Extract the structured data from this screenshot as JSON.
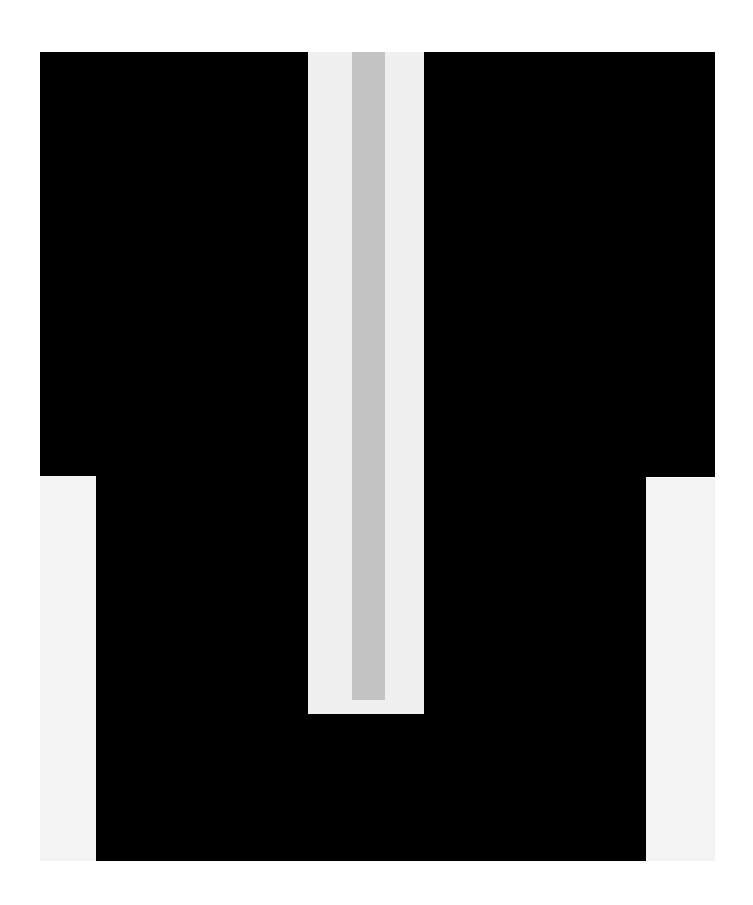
{
  "artwork": {
    "description": "Abstract geometric composition: black stepped form with a vertical light panel and gray stripe",
    "colors": {
      "black": "#000000",
      "light_panel": "#f0f0f0",
      "side_panels": "#f3f3f3",
      "gray_stripe": "#c4c4c4",
      "background": "#ffffff"
    }
  }
}
